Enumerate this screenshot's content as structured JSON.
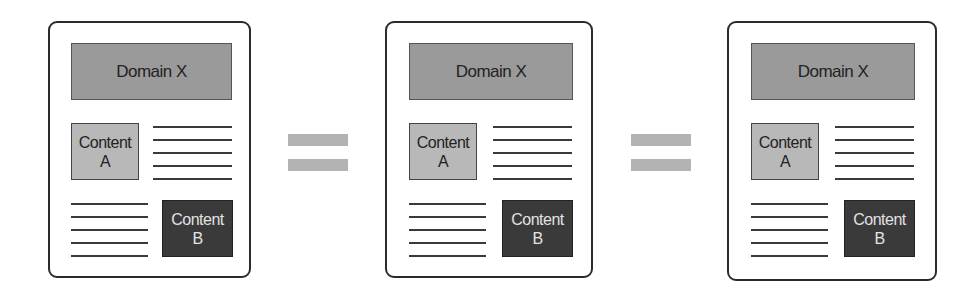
{
  "panels": [
    {
      "domain_label": "Domain X",
      "content_a": {
        "line1": "Content",
        "line2": "A"
      },
      "content_b": {
        "line1": "Content",
        "line2": "B"
      }
    },
    {
      "domain_label": "Domain X",
      "content_a": {
        "line1": "Content",
        "line2": "A"
      },
      "content_b": {
        "line1": "Content",
        "line2": "B"
      }
    },
    {
      "domain_label": "Domain X",
      "content_a": {
        "line1": "Content",
        "line2": "A"
      },
      "content_b": {
        "line1": "Content",
        "line2": "B"
      }
    }
  ],
  "operators": [
    "equals",
    "equals"
  ],
  "colors": {
    "domain_fill": "#9a9a9a",
    "content_a_fill": "#b8b8b8",
    "content_b_fill": "#3a3a3a",
    "equals_fill": "#b3b3b3",
    "border": "#2b2b2b"
  }
}
